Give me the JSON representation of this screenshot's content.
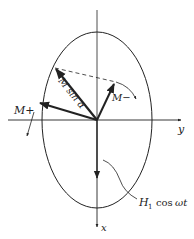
{
  "diagram": {
    "type": "vector-phasor",
    "labels": {
      "m_plus": "M+",
      "m_minus": "M−",
      "m_sin_alpha": "M sin α",
      "y_axis": "y",
      "x_axis": "x",
      "field_h": "H",
      "field_sub": "1",
      "field_cos": "cos",
      "field_omega_t": "ωt"
    },
    "colors": {
      "ink": "#222222",
      "background": "#ffffff"
    }
  }
}
